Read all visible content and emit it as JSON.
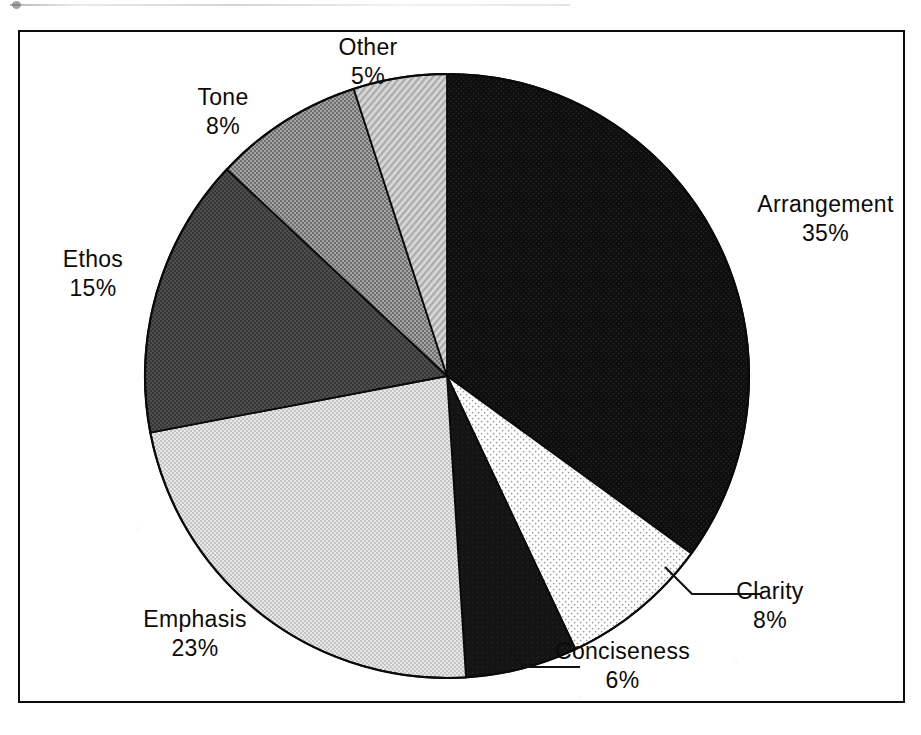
{
  "figure": {
    "frame_color": "#0d0d0d",
    "background": "#ffffff"
  },
  "chart_data": {
    "type": "pie",
    "title": "",
    "subtitle": "",
    "xlabel": "",
    "ylabel": "",
    "legend_position": "none",
    "grid": false,
    "units": "%",
    "start_angle_deg": 0,
    "direction": "clockwise",
    "total": 100,
    "categories": [
      "Arrangement",
      "Clarity",
      "Conciseness",
      "Emphasis",
      "Ethos",
      "Tone",
      "Other"
    ],
    "values": [
      35,
      8,
      6,
      23,
      15,
      8,
      5
    ],
    "slices": [
      {
        "label": "Arrangement",
        "value": 35,
        "value_text": "35%",
        "fill": "#111111",
        "pattern": "solid-black-halftone",
        "start_deg": 0,
        "end_deg": 126,
        "leader_line": false
      },
      {
        "label": "Clarity",
        "value": 8,
        "value_text": "8%",
        "fill": "#fbfbfb",
        "pattern": "sparse-dots",
        "start_deg": 126,
        "end_deg": 154.8,
        "leader_line": true
      },
      {
        "label": "Conciseness",
        "value": 6,
        "value_text": "6%",
        "fill": "#1a1a1a",
        "pattern": "solid-black",
        "start_deg": 154.8,
        "end_deg": 176.4,
        "leader_line": true
      },
      {
        "label": "Emphasis",
        "value": 23,
        "value_text": "23%",
        "fill": "#d2d2d2",
        "pattern": "light-halftone",
        "start_deg": 176.4,
        "end_deg": 259.2,
        "leader_line": false
      },
      {
        "label": "Ethos",
        "value": 15,
        "value_text": "15%",
        "fill": "#4a4a4a",
        "pattern": "dark-halftone",
        "start_deg": 259.2,
        "end_deg": 313.2,
        "leader_line": false
      },
      {
        "label": "Tone",
        "value": 8,
        "value_text": "8%",
        "fill": "#8e8e8e",
        "pattern": "medium-halftone",
        "start_deg": 313.2,
        "end_deg": 342,
        "leader_line": false
      },
      {
        "label": "Other",
        "value": 5,
        "value_text": "5%",
        "fill": "#bdbdbd",
        "pattern": "diagonal-hatch",
        "start_deg": 342,
        "end_deg": 360,
        "leader_line": false
      }
    ]
  }
}
